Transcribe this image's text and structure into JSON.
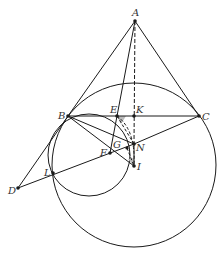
{
  "diagram": {
    "stroke_color": "#1a1a1a",
    "fill_shade": "#bbbbbb",
    "points": {
      "A": {
        "label": "A",
        "x": 135,
        "y": 21
      },
      "B": {
        "label": "B",
        "x": 68,
        "y": 116
      },
      "C": {
        "label": "C",
        "x": 199,
        "y": 116
      },
      "E": {
        "label": "E",
        "x": 117,
        "y": 116
      },
      "K": {
        "label": "K",
        "x": 134,
        "y": 116
      },
      "G": {
        "label": "G",
        "x": 127,
        "y": 148
      },
      "N": {
        "label": "N",
        "x": 134,
        "y": 144
      },
      "F": {
        "label": "F",
        "x": 110,
        "y": 153
      },
      "I": {
        "label": "I",
        "x": 134,
        "y": 166
      },
      "L": {
        "label": "L",
        "x": 53,
        "y": 173
      },
      "D": {
        "label": "D",
        "x": 18,
        "y": 188
      }
    },
    "circles": [
      {
        "name": "large-circle",
        "cx": 134,
        "cy": 165,
        "r": 82
      },
      {
        "name": "small-circle",
        "cx": 89,
        "cy": 155,
        "r": 41
      }
    ]
  }
}
